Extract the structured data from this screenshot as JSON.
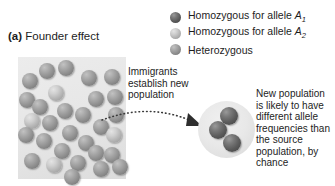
{
  "figure": {
    "label_tag": "(a)",
    "title": "Founder effect"
  },
  "legend": {
    "items": [
      {
        "name": "legend-homozygous-a1",
        "swatch": "sphere-dark-icon",
        "color": "#5a5a5a",
        "prefix": "Homozygous for allele ",
        "allele": "A",
        "subscript": "1"
      },
      {
        "name": "legend-homozygous-a2",
        "swatch": "sphere-light-icon",
        "color": "#b2b2b2",
        "prefix": "Homozygous for allele ",
        "allele": "A",
        "subscript": "2"
      },
      {
        "name": "legend-heterozygous",
        "swatch": "sphere-mid-icon",
        "color": "#8d8d8d",
        "prefix": "Heterozygous",
        "allele": "",
        "subscript": ""
      }
    ]
  },
  "captions": {
    "migration": "Immigrants\nestablish new\npopulation",
    "migration_lines": [
      "Immigrants",
      "establish new",
      "population"
    ],
    "outcome": "New population is likely to have different allele frequencies than the source population, by chance"
  },
  "source_population": {
    "name": "source-population-box",
    "background": "#e6e6e6",
    "sphere_count": 30,
    "spheres": [
      {
        "x": 21,
        "y": 6,
        "r": 8,
        "type": "mid"
      },
      {
        "x": 40,
        "y": 3,
        "r": 8,
        "type": "mid"
      },
      {
        "x": 4,
        "y": 16,
        "r": 8,
        "type": "mid"
      },
      {
        "x": 63,
        "y": 13,
        "r": 8,
        "type": "mid"
      },
      {
        "x": 86,
        "y": 12,
        "r": 8,
        "type": "mid"
      },
      {
        "x": 30,
        "y": 28,
        "r": 8,
        "type": "light"
      },
      {
        "x": 1,
        "y": 35,
        "r": 8,
        "type": "mid"
      },
      {
        "x": 70,
        "y": 34,
        "r": 8,
        "type": "mid"
      },
      {
        "x": 89,
        "y": 32,
        "r": 8,
        "type": "mid"
      },
      {
        "x": 14,
        "y": 42,
        "r": 8,
        "type": "mid"
      },
      {
        "x": 39,
        "y": 46,
        "r": 8,
        "type": "mid"
      },
      {
        "x": 57,
        "y": 50,
        "r": 8,
        "type": "mid"
      },
      {
        "x": 90,
        "y": 50,
        "r": 8,
        "type": "mid"
      },
      {
        "x": 6,
        "y": 56,
        "r": 8,
        "type": "light"
      },
      {
        "x": 24,
        "y": 58,
        "r": 8,
        "type": "mid"
      },
      {
        "x": 75,
        "y": 62,
        "r": 8,
        "type": "mid"
      },
      {
        "x": 0,
        "y": 70,
        "r": 8,
        "type": "mid"
      },
      {
        "x": 44,
        "y": 68,
        "r": 8,
        "type": "mid"
      },
      {
        "x": 88,
        "y": 70,
        "r": 8,
        "type": "light"
      },
      {
        "x": 18,
        "y": 76,
        "r": 8,
        "type": "mid"
      },
      {
        "x": 60,
        "y": 78,
        "r": 8,
        "type": "mid"
      },
      {
        "x": 36,
        "y": 86,
        "r": 8,
        "type": "mid"
      },
      {
        "x": 70,
        "y": 88,
        "r": 8,
        "type": "mid"
      },
      {
        "x": 86,
        "y": 90,
        "r": 8,
        "type": "mid"
      },
      {
        "x": 6,
        "y": 96,
        "r": 8,
        "type": "mid"
      },
      {
        "x": 28,
        "y": 100,
        "r": 8,
        "type": "light"
      },
      {
        "x": 52,
        "y": 98,
        "r": 8,
        "type": "mid"
      },
      {
        "x": 75,
        "y": 104,
        "r": 8,
        "type": "mid"
      },
      {
        "x": 94,
        "y": 102,
        "r": 8,
        "type": "mid"
      },
      {
        "x": 46,
        "y": 112,
        "r": 8,
        "type": "mid"
      }
    ]
  },
  "new_population": {
    "name": "new-population-circle",
    "background": "#e8e8e8",
    "sphere_count": 3,
    "spheres": [
      {
        "x": 22,
        "y": 6,
        "r": 9,
        "type": "dark"
      },
      {
        "x": 11,
        "y": 20,
        "r": 9,
        "type": "dark"
      },
      {
        "x": 25,
        "y": 33,
        "r": 9,
        "type": "dark"
      }
    ]
  },
  "arrow": {
    "name": "migration-arrow",
    "style": "dotted-curved",
    "color": "#3a3a3a"
  }
}
